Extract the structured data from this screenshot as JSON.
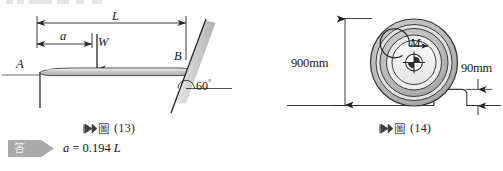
{
  "page": {
    "background_color": "#ffffff",
    "line_color": "#262626",
    "fill_gray": "#c9c9c9",
    "tag_gray": "#a9a9a9"
  },
  "figure13": {
    "name": "cantilever-beam-diagram",
    "labels": {
      "length_total": "L",
      "length_partial": "a",
      "load": "W",
      "point_left": "A",
      "point_right": "B",
      "angle": "60",
      "angle_unit": "°"
    },
    "caption": {
      "flag_icon": "double-arrow-flag-icon",
      "chinese_word": "圖",
      "number": "(13)"
    }
  },
  "figure14": {
    "name": "wheel-over-step-diagram",
    "labels": {
      "wheel_diameter": "900mm",
      "step_height": "90mm",
      "moment": "M"
    },
    "center_icon": "crosshair-center-icon",
    "moment_icon": "moment-arrow-icon",
    "caption": {
      "flag_icon": "double-arrow-flag-icon",
      "chinese_word": "圖",
      "number": "(14)"
    }
  },
  "answer": {
    "tag_label": "答",
    "variable": "a",
    "equals": "=",
    "value": "0.194",
    "unit": "L",
    "full_text": "a = 0.194 L"
  }
}
